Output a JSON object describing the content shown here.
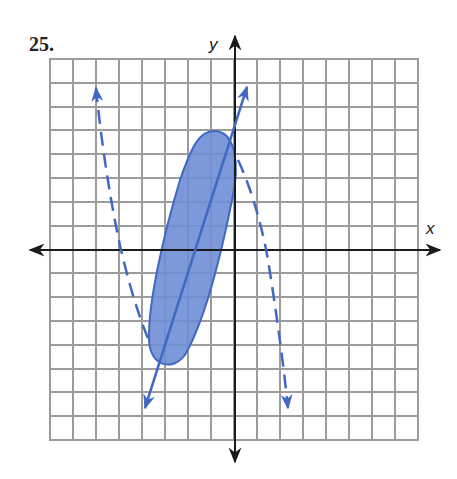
{
  "problem": {
    "number": "25."
  },
  "axes": {
    "x_label": "x",
    "y_label": "y"
  },
  "grid": {
    "columns": 16,
    "rows": 16,
    "x_min": -8,
    "x_max": 8,
    "y_min": -8,
    "y_max": 8
  },
  "colors": {
    "grid": "#9c9c9c",
    "axis": "#1a1a1a",
    "curve": "#4169c2",
    "fill": "#6f8ed6"
  },
  "figures": [
    {
      "name": "shaded-ellipse-region",
      "type": "ellipse",
      "style": "solid-boundary-shaded",
      "approx_top": [
        -1,
        5
      ],
      "approx_bottom": [
        -3,
        -5
      ]
    },
    {
      "name": "solid-line",
      "type": "line",
      "style": "solid-with-arrows",
      "approx_points": [
        [
          -4,
          -7
        ],
        [
          0.5,
          7
        ]
      ]
    },
    {
      "name": "dashed-cubic",
      "type": "curve",
      "style": "dashed-with-arrows",
      "approx_points": [
        [
          -6,
          7
        ],
        [
          -5,
          0
        ],
        [
          -3.5,
          -4
        ],
        [
          0,
          4
        ],
        [
          1,
          0
        ],
        [
          2,
          -7
        ]
      ]
    }
  ]
}
